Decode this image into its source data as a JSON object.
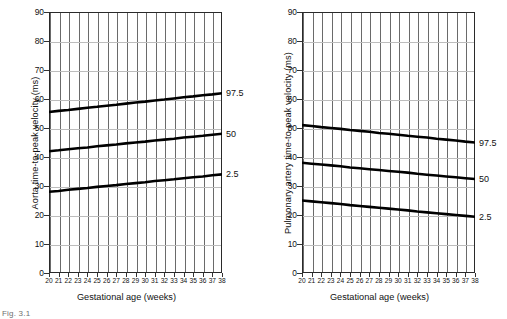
{
  "figure": {
    "caption": "Fig. 3.1",
    "panel_count": 2
  },
  "chart_data": [
    {
      "type": "line",
      "id": "aorta",
      "title": "",
      "xlabel": "Gestational age (weeks)",
      "ylabel": "Aorta time-to-peak velocity (ms)",
      "xlim": [
        20,
        38
      ],
      "ylim": [
        0,
        90
      ],
      "grid": true,
      "legend_position": "right-of-axis",
      "x": [
        20,
        21,
        22,
        23,
        24,
        25,
        26,
        27,
        28,
        29,
        30,
        31,
        32,
        33,
        34,
        35,
        36,
        37,
        38
      ],
      "xticklabels": [
        "20",
        "21",
        "22",
        "23",
        "24",
        "25",
        "26",
        "27",
        "28",
        "29",
        "30",
        "31",
        "32",
        "33",
        "34",
        "35",
        "36",
        "37",
        "38"
      ],
      "yticks": [
        0,
        10,
        20,
        30,
        40,
        50,
        60,
        70,
        80,
        90
      ],
      "yticklabels": [
        "0",
        "10",
        "20",
        "30",
        "40",
        "50",
        "60",
        "70",
        "80",
        "90"
      ],
      "series": [
        {
          "name": "97.5",
          "label": "97.5",
          "values": [
            55.5,
            55.9,
            56.2,
            56.6,
            57.0,
            57.3,
            57.7,
            58.0,
            58.4,
            58.8,
            59.1,
            59.5,
            59.8,
            60.2,
            60.6,
            60.9,
            61.3,
            61.6,
            62.0
          ]
        },
        {
          "name": "50",
          "label": "50",
          "values": [
            42.0,
            42.3,
            42.7,
            43.0,
            43.3,
            43.7,
            44.0,
            44.3,
            44.7,
            45.0,
            45.3,
            45.7,
            46.0,
            46.3,
            46.7,
            47.0,
            47.3,
            47.7,
            48.0
          ]
        },
        {
          "name": "2.5",
          "label": "2.5",
          "values": [
            28.0,
            28.3,
            28.7,
            29.0,
            29.3,
            29.7,
            30.0,
            30.3,
            30.7,
            31.0,
            31.3,
            31.7,
            32.0,
            32.3,
            32.7,
            33.0,
            33.3,
            33.7,
            34.0
          ]
        }
      ]
    },
    {
      "type": "line",
      "id": "pulmonary-artery",
      "title": "",
      "xlabel": "Gestational age (weeks)",
      "ylabel": "Pulmonary artery time-to-peak velocity (ms)",
      "xlim": [
        20,
        38
      ],
      "ylim": [
        0,
        90
      ],
      "grid": true,
      "legend_position": "right-of-axis",
      "x": [
        20,
        21,
        22,
        23,
        24,
        25,
        26,
        27,
        28,
        29,
        30,
        31,
        32,
        33,
        34,
        35,
        36,
        37,
        38
      ],
      "xticklabels": [
        "20",
        "21",
        "22",
        "23",
        "24",
        "25",
        "26",
        "27",
        "28",
        "29",
        "30",
        "31",
        "32",
        "33",
        "34",
        "35",
        "36",
        "37",
        "38"
      ],
      "yticks": [
        0,
        10,
        20,
        30,
        40,
        50,
        60,
        70,
        80,
        90
      ],
      "yticklabels": [
        "0",
        "10",
        "20",
        "30",
        "40",
        "50",
        "60",
        "70",
        "80",
        "90"
      ],
      "series": [
        {
          "name": "97.5",
          "label": "97.5",
          "values": [
            51.0,
            50.7,
            50.3,
            50.0,
            49.7,
            49.3,
            49.0,
            48.7,
            48.3,
            48.0,
            47.7,
            47.3,
            47.0,
            46.7,
            46.3,
            46.0,
            45.7,
            45.3,
            45.0
          ]
        },
        {
          "name": "50",
          "label": "50",
          "values": [
            38.0,
            37.7,
            37.4,
            37.1,
            36.8,
            36.4,
            36.1,
            35.8,
            35.5,
            35.2,
            34.9,
            34.6,
            34.2,
            33.9,
            33.6,
            33.3,
            33.0,
            32.7,
            32.4
          ]
        },
        {
          "name": "2.5",
          "label": "2.5",
          "values": [
            25.0,
            24.7,
            24.4,
            24.1,
            23.8,
            23.4,
            23.1,
            22.8,
            22.5,
            22.2,
            21.9,
            21.6,
            21.2,
            20.9,
            20.6,
            20.3,
            20.0,
            19.7,
            19.4
          ]
        }
      ]
    }
  ]
}
